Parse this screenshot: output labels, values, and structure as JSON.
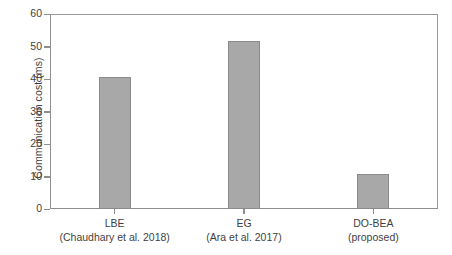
{
  "chart_data": {
    "type": "bar",
    "title": "",
    "subtitle": "",
    "xlabel": "",
    "ylabel": "Communication cost (ms)",
    "categories": [
      "LBE",
      "EG",
      "DO-BEA"
    ],
    "category_sublabels": [
      "(Chaudhary et al. 2018)",
      "(Ara et al. 2017)",
      "(proposed)"
    ],
    "values": [
      40.7,
      51.8,
      10.7
    ],
    "ylim": [
      0,
      60
    ],
    "yticks": [
      0,
      10,
      20,
      30,
      40,
      50,
      60
    ],
    "ytick_labels": [
      "0",
      "10",
      "20",
      "30",
      "40",
      "50",
      "60"
    ],
    "grid": false,
    "legend": false,
    "legend_position": "none",
    "bar_fill_color": "#a8a8a8",
    "bar_border_color": "#8b8b8b",
    "axis_color": "#8e8e8e",
    "text_color": "#3f3f3f",
    "background_color": "#ffffff"
  }
}
